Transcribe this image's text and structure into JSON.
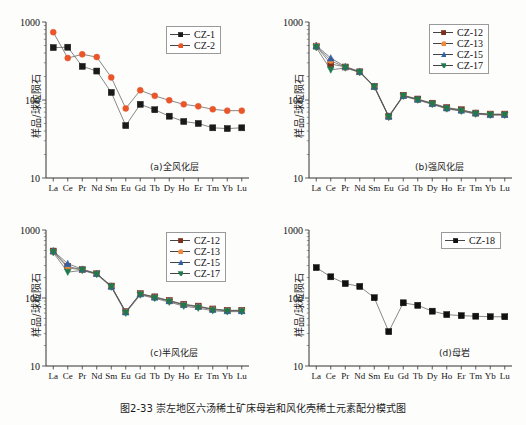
{
  "caption": "图2-33  崇左地区六汤稀土矿床母岩和风化壳稀土元素配分模式图",
  "axis": {
    "ylabel": "样品/球粒陨石",
    "ytick_labels": [
      "1000",
      "100",
      "10"
    ],
    "ylim": [
      10,
      1000
    ],
    "elements": [
      "La",
      "Ce",
      "Pr",
      "Nd",
      "Sm",
      "Eu",
      "Gd",
      "Tb",
      "Dy",
      "Ho",
      "Er",
      "Tm",
      "Yb",
      "Lu"
    ]
  },
  "colors": {
    "cz1": "#1a1a1a",
    "cz2": "#e8562a",
    "cz12": "#7a2f1d",
    "cz13": "#ef8a3c",
    "cz15": "#2f5fa8",
    "cz17": "#1f7a4d",
    "cz18": "#111111"
  },
  "panels": [
    {
      "tag": "(a)全风化层",
      "legend": [
        "CZ-1",
        "CZ-2"
      ]
    },
    {
      "tag": "(b)强风化层",
      "legend": [
        "CZ-12",
        "CZ-13",
        "CZ-15",
        "CZ-17"
      ]
    },
    {
      "tag": "(c)半风化层",
      "legend": [
        "CZ-12",
        "CZ-13",
        "CZ-15",
        "CZ-17"
      ]
    },
    {
      "tag": "(d)母岩",
      "legend": [
        "CZ-18"
      ]
    }
  ],
  "chart_data": [
    {
      "type": "line",
      "title": "(a)全风化层",
      "xlabel": "",
      "ylabel": "样品/球粒陨石",
      "categories": [
        "La",
        "Ce",
        "Pr",
        "Nd",
        "Sm",
        "Eu",
        "Gd",
        "Tb",
        "Dy",
        "Ho",
        "Er",
        "Tm",
        "Yb",
        "Lu"
      ],
      "ylim": [
        10,
        1000
      ],
      "yscale": "log",
      "grid": false,
      "legend_position": "top-right",
      "series": [
        {
          "name": "CZ-1",
          "marker": "square",
          "color": "#1a1a1a",
          "values": [
            470,
            475,
            270,
            235,
            125,
            47,
            88,
            75,
            62,
            53,
            50,
            44,
            43,
            44
          ]
        },
        {
          "name": "CZ-2",
          "marker": "circle",
          "color": "#e8562a",
          "values": [
            740,
            345,
            385,
            355,
            195,
            78,
            133,
            113,
            99,
            88,
            83,
            76,
            73,
            73
          ]
        }
      ]
    },
    {
      "type": "line",
      "title": "(b)强风化层",
      "xlabel": "",
      "ylabel": "样品/球粒陨石",
      "categories": [
        "La",
        "Ce",
        "Pr",
        "Nd",
        "Sm",
        "Eu",
        "Gd",
        "Tb",
        "Dy",
        "Ho",
        "Er",
        "Tm",
        "Yb",
        "Lu"
      ],
      "ylim": [
        10,
        1000
      ],
      "yscale": "log",
      "grid": false,
      "legend_position": "top-right",
      "series": [
        {
          "name": "CZ-12",
          "marker": "square",
          "color": "#7a2f1d",
          "values": [
            490,
            290,
            265,
            230,
            150,
            62,
            115,
            103,
            91,
            80,
            75,
            68,
            66,
            66
          ]
        },
        {
          "name": "CZ-13",
          "marker": "circle",
          "color": "#ef8a3c",
          "values": [
            495,
            320,
            262,
            228,
            148,
            61,
            113,
            101,
            89,
            78,
            73,
            67,
            65,
            65
          ]
        },
        {
          "name": "CZ-15",
          "marker": "triangle",
          "color": "#2f5fa8",
          "values": [
            500,
            345,
            268,
            232,
            150,
            62,
            114,
            102,
            90,
            79,
            74,
            68,
            65,
            65
          ]
        },
        {
          "name": "CZ-17",
          "marker": "triangle-down",
          "color": "#1f7a4d",
          "values": [
            470,
            243,
            258,
            225,
            147,
            60,
            112,
            100,
            88,
            77,
            72,
            66,
            64,
            64
          ]
        }
      ]
    },
    {
      "type": "line",
      "title": "(c)半风化层",
      "xlabel": "",
      "ylabel": "样品/球粒陨石",
      "categories": [
        "La",
        "Ce",
        "Pr",
        "Nd",
        "Sm",
        "Eu",
        "Gd",
        "Tb",
        "Dy",
        "Ho",
        "Er",
        "Tm",
        "Yb",
        "Lu"
      ],
      "ylim": [
        10,
        1000
      ],
      "yscale": "log",
      "grid": false,
      "legend_position": "top-right",
      "series": [
        {
          "name": "CZ-12",
          "marker": "square",
          "color": "#7a2f1d",
          "values": [
            490,
            290,
            262,
            228,
            150,
            63,
            116,
            104,
            92,
            81,
            76,
            69,
            66,
            66
          ]
        },
        {
          "name": "CZ-13",
          "marker": "circle",
          "color": "#ef8a3c",
          "values": [
            480,
            278,
            258,
            226,
            148,
            62,
            114,
            102,
            90,
            79,
            74,
            68,
            65,
            65
          ]
        },
        {
          "name": "CZ-15",
          "marker": "triangle",
          "color": "#2f5fa8",
          "values": [
            495,
            320,
            265,
            230,
            149,
            62,
            115,
            103,
            91,
            80,
            75,
            68,
            65,
            65
          ]
        },
        {
          "name": "CZ-17",
          "marker": "triangle-down",
          "color": "#1f7a4d",
          "values": [
            465,
            240,
            255,
            222,
            145,
            60,
            111,
            99,
            87,
            76,
            71,
            65,
            63,
            63
          ]
        }
      ]
    },
    {
      "type": "line",
      "title": "(d)母岩",
      "xlabel": "",
      "ylabel": "样品/球粒陨石",
      "categories": [
        "La",
        "Ce",
        "Pr",
        "Nd",
        "Sm",
        "Eu",
        "Gd",
        "Tb",
        "Dy",
        "Ho",
        "Er",
        "Tm",
        "Yb",
        "Lu"
      ],
      "ylim": [
        10,
        1000
      ],
      "yscale": "log",
      "grid": false,
      "legend_position": "top-right",
      "series": [
        {
          "name": "CZ-18",
          "marker": "square",
          "color": "#111111",
          "values": [
            280,
            205,
            163,
            148,
            101,
            32,
            85,
            78,
            64,
            57,
            55,
            54,
            53,
            53
          ]
        }
      ]
    }
  ]
}
